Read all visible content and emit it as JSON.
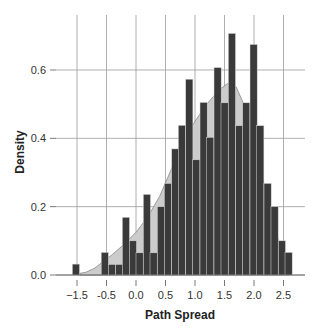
{
  "chart_data": {
    "type": "bar",
    "subtype": "histogram_with_density",
    "title": "",
    "xlabel": "Path Spread",
    "ylabel": "Density",
    "x_ticks": [
      {
        "label": "−1.5",
        "value": -1.0
      },
      {
        "label": "-0.5",
        "value": -0.5
      },
      {
        "label": "0.0",
        "value": 0.0
      },
      {
        "label": "0.5",
        "value": 0.5
      },
      {
        "label": "1.0",
        "value": 1.0
      },
      {
        "label": "1.5",
        "value": 1.5
      },
      {
        "label": "2.0",
        "value": 2.0
      },
      {
        "label": "2.5",
        "value": 2.5
      }
    ],
    "y_ticks": [
      {
        "label": "0.0",
        "value": 0.0
      },
      {
        "label": "0.2",
        "value": 0.2
      },
      {
        "label": "0.4",
        "value": 0.4
      },
      {
        "label": "0.6",
        "value": 0.6
      }
    ],
    "ylim": [
      0,
      0.75
    ],
    "grid": true,
    "bin_width": 0.122,
    "bins": [
      {
        "x": -1.08,
        "density": 0.032
      },
      {
        "x": -0.59,
        "density": 0.066
      },
      {
        "x": -0.47,
        "density": 0.031
      },
      {
        "x": -0.345,
        "density": 0.031
      },
      {
        "x": -0.233,
        "density": 0.169
      },
      {
        "x": -0.114,
        "density": 0.1
      },
      {
        "x": 0.0,
        "density": 0.065
      },
      {
        "x": 0.124,
        "density": 0.236
      },
      {
        "x": 0.237,
        "density": 0.065
      },
      {
        "x": 0.361,
        "density": 0.2
      },
      {
        "x": 0.48,
        "density": 0.268
      },
      {
        "x": 0.605,
        "density": 0.369
      },
      {
        "x": 0.717,
        "density": 0.438
      },
      {
        "x": 0.842,
        "density": 0.573
      },
      {
        "x": 0.961,
        "density": 0.337
      },
      {
        "x": 1.085,
        "density": 0.505
      },
      {
        "x": 1.198,
        "density": 0.403
      },
      {
        "x": 1.322,
        "density": 0.607
      },
      {
        "x": 1.441,
        "density": 0.504
      },
      {
        "x": 1.565,
        "density": 0.707
      },
      {
        "x": 1.69,
        "density": 0.437
      },
      {
        "x": 1.808,
        "density": 0.504
      },
      {
        "x": 1.932,
        "density": 0.675
      },
      {
        "x": 2.046,
        "density": 0.437
      },
      {
        "x": 2.17,
        "density": 0.268
      },
      {
        "x": 2.288,
        "density": 0.2
      },
      {
        "x": 2.412,
        "density": 0.1
      },
      {
        "x": 2.525,
        "density": 0.066
      }
    ],
    "density_curve": {
      "x": [
        -0.95,
        -0.85,
        -0.7,
        -0.55,
        -0.4,
        -0.2,
        0.0,
        0.2,
        0.4,
        0.6,
        0.8,
        1.0,
        1.2,
        1.4,
        1.55,
        1.7,
        1.85,
        2.0,
        2.15,
        2.3,
        2.45,
        2.6
      ],
      "y": [
        0.005,
        0.008,
        0.02,
        0.04,
        0.06,
        0.09,
        0.125,
        0.17,
        0.23,
        0.31,
        0.39,
        0.45,
        0.5,
        0.54,
        0.56,
        0.55,
        0.49,
        0.4,
        0.28,
        0.17,
        0.08,
        0.01
      ]
    }
  },
  "colors": {
    "bar_fill": "#3a3a3a",
    "bar_stroke": "#d9d9d9",
    "density_fill": "#cccccc",
    "density_stroke": "#888888",
    "grid": "#9a9a9a",
    "text": "#333333"
  }
}
